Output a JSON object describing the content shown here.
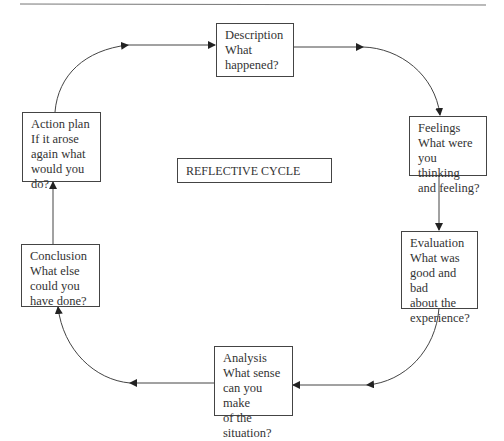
{
  "diagram": {
    "title": "REFLECTIVE CYCLE",
    "colors": {
      "line": "#444444",
      "text": "#333333",
      "background": "#ffffff"
    },
    "stages": [
      {
        "id": "description",
        "heading": "Description",
        "lines": [
          "What",
          "happened?"
        ]
      },
      {
        "id": "feelings",
        "heading": "Feelings",
        "lines": [
          "What were",
          "you thinking",
          "and feeling?"
        ]
      },
      {
        "id": "evaluation",
        "heading": "Evaluation",
        "lines": [
          "What was",
          "good and bad",
          "about the",
          "experience?"
        ]
      },
      {
        "id": "analysis",
        "heading": "Analysis",
        "lines": [
          "What sense",
          "can you make",
          "of the",
          "situation?"
        ]
      },
      {
        "id": "conclusion",
        "heading": "Conclusion",
        "lines": [
          "What else",
          "could you",
          "have done?"
        ]
      },
      {
        "id": "action-plan",
        "heading": "Action plan",
        "lines": [
          "If it arose",
          "again what",
          "would you",
          "do?"
        ]
      }
    ],
    "flow": [
      "Description",
      "Feelings",
      "Evaluation",
      "Analysis",
      "Conclusion",
      "Action plan",
      "Description"
    ]
  }
}
